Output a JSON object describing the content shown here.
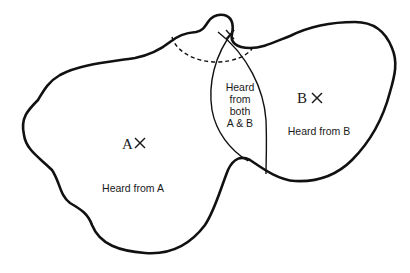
{
  "diagram": {
    "type": "venn-region-map",
    "colors": {
      "stroke": "#111111",
      "background": "#ffffff"
    },
    "source_a": {
      "letter": "A",
      "marker": "×",
      "region_label": "Heard from A"
    },
    "source_b": {
      "letter": "B",
      "marker": "×",
      "region_label": "Heard from B"
    },
    "overlap": {
      "lines": [
        "Heard",
        "from",
        "both",
        "A & B"
      ]
    },
    "top_marker": "×"
  }
}
